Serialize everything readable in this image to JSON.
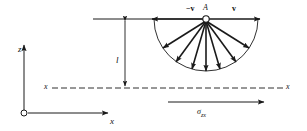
{
  "figure": {
    "background_color": "#ffffff",
    "stroke_color": "#1a1a1a",
    "width": 307,
    "height": 131
  },
  "axes": {
    "origin_marker": "open-circle",
    "z_axis_label": "z",
    "x_axis_label": "x",
    "reference_line_left_label": "x",
    "reference_line_right_label": "x",
    "reference_line_style": "dash-dot"
  },
  "dimension": {
    "label": "l",
    "description": "height of source A above the x–x reference line"
  },
  "source": {
    "point_label": "A",
    "marker": "open-circle"
  },
  "vectors": {
    "right_label": "v",
    "left_label": "−v",
    "fan_count": 7,
    "fan_description": "semicircular fan of velocity arrows radiating from A"
  },
  "stress": {
    "symbol": "σ",
    "subscript": "zx",
    "direction": "right",
    "label_full": "σzx"
  }
}
